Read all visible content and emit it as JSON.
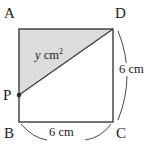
{
  "figure": {
    "colors": {
      "stroke": "#3a3a3a",
      "shade_fill": "#dcdcdc",
      "text": "#1a1a1a",
      "background": "#ffffff"
    },
    "vertices": [
      {
        "name": "A",
        "label": "A",
        "x": 19,
        "y": 29,
        "label_x": 4,
        "label_y": 6
      },
      {
        "name": "D",
        "label": "D",
        "x": 113,
        "y": 29,
        "label_x": 115,
        "label_y": 6
      },
      {
        "name": "C",
        "label": "C",
        "x": 113,
        "y": 122,
        "label_x": 116,
        "label_y": 128
      },
      {
        "name": "B",
        "label": "B",
        "x": 19,
        "y": 122,
        "label_x": 4,
        "label_y": 128
      },
      {
        "name": "P",
        "label": "P",
        "x": 19,
        "y": 95,
        "label_x": 3,
        "label_y": 88
      }
    ],
    "shaded_region": {
      "label_var": "y",
      "label_unit": "cm",
      "label_sup": "2",
      "label_x": 35,
      "label_y": 48,
      "polygon": "19,29 113,29 19,95"
    },
    "dimensions": [
      {
        "name": "side-dc",
        "text": "6 cm",
        "label_x": 118,
        "label_y": 69,
        "arc": "M 118,31 Q 136,75 118,120"
      },
      {
        "name": "side-bc",
        "text": "6 cm",
        "label_x": 50,
        "label_y": 131,
        "arc_left": "M 21,124 Q 33,138 47,140",
        "arc_right": "M 85,140 Q 101,138 111,124"
      }
    ]
  }
}
